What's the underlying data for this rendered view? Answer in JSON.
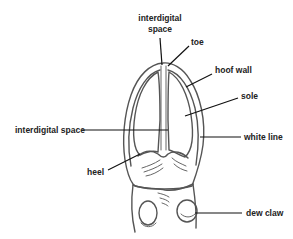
{
  "diagram": {
    "labels": {
      "interdigital_top_line1": "interdigital",
      "interdigital_top_line2": "space",
      "toe": "toe",
      "hoof_wall": "hoof wall",
      "sole": "sole",
      "interdigital_left": "interdigital space",
      "white_line": "white line",
      "heel": "heel",
      "dew_claw": "dew claw"
    },
    "colors": {
      "background": "#ffffff",
      "outline": "#555555",
      "text": "#222222"
    }
  }
}
